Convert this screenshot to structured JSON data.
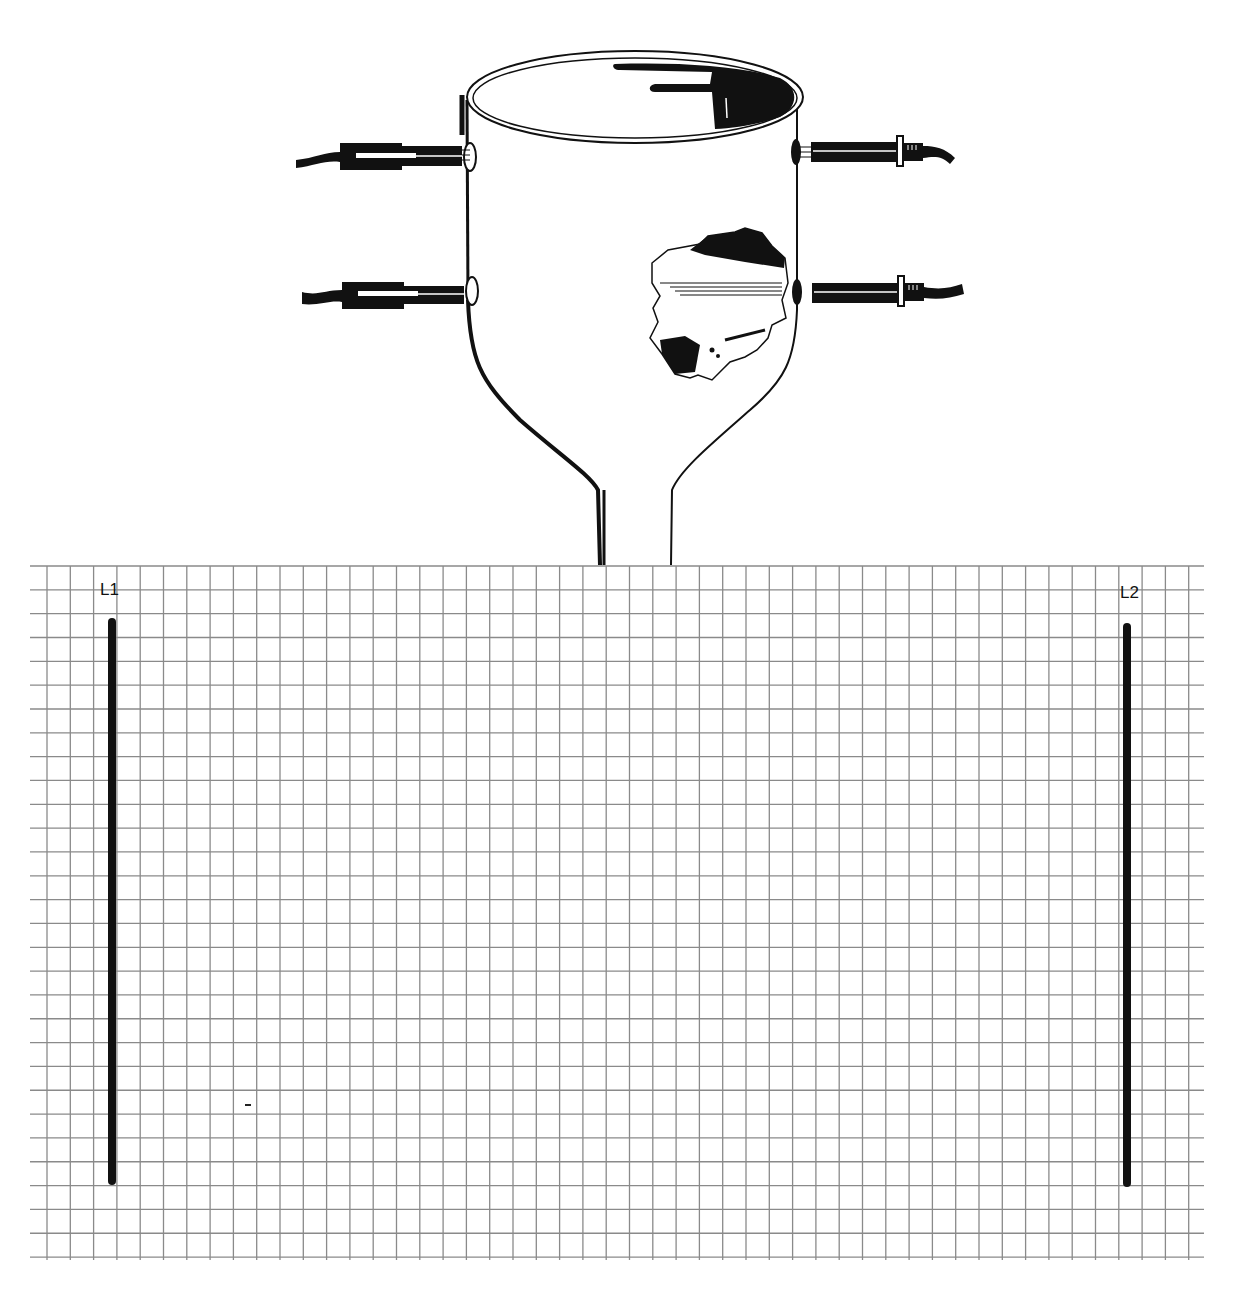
{
  "figure": {
    "colors": {
      "ink": "#111111",
      "grid": "#8a8a8a",
      "background": "#ffffff"
    }
  },
  "grid": {
    "left": 30,
    "right": 1204,
    "top": 566,
    "bottom": 1257,
    "first_col_x": 47,
    "col_step": 23.3,
    "cols": 50,
    "row_step": 23.83,
    "rows": 29
  },
  "electrodes": [
    {
      "label": "L1",
      "x": 112,
      "top": 618,
      "bottom": 1185,
      "label_x": 100,
      "label_y": 580
    },
    {
      "label": "L2",
      "x": 1127,
      "top": 623,
      "bottom": 1187,
      "label_x": 1120,
      "label_y": 583
    }
  ],
  "vessel": {
    "rim_center_x": 635,
    "rim_center_y": 97,
    "rim_rx": 168,
    "rim_ry": 46,
    "connectors": [
      {
        "side": "left",
        "y": 157
      },
      {
        "side": "left",
        "y": 295
      },
      {
        "side": "right",
        "y": 152
      },
      {
        "side": "right",
        "y": 292
      }
    ]
  },
  "annotations": {
    "stray_mark": {
      "x": 245,
      "y": 1104
    }
  }
}
